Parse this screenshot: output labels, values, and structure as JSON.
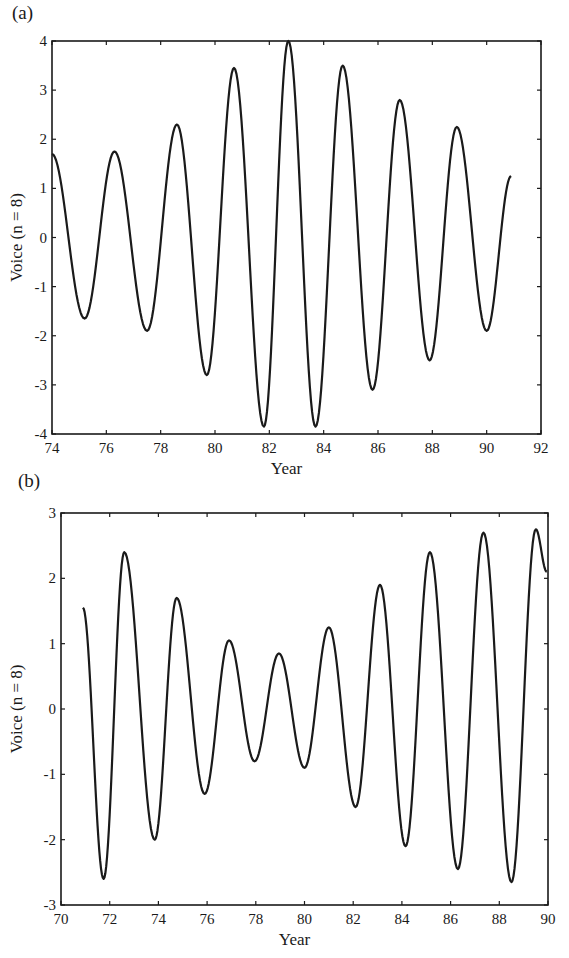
{
  "chart_data": [
    {
      "type": "line",
      "panel_label": "(a)",
      "title": "",
      "xlabel": "Year",
      "ylabel": "Voice (n = 8)",
      "xlim": [
        74,
        92
      ],
      "ylim": [
        -4,
        4
      ],
      "xticks": [
        74,
        76,
        78,
        80,
        82,
        84,
        86,
        88,
        90,
        92
      ],
      "yticks": [
        4,
        3,
        2,
        1,
        0,
        -1,
        -2,
        -3,
        -4
      ],
      "grid": false,
      "legend": null,
      "series": [
        {
          "name": "Voice (n = 8)",
          "x": [
            74.0,
            75.2,
            76.3,
            77.5,
            78.6,
            79.7,
            80.7,
            81.8,
            82.7,
            83.7,
            84.7,
            85.8,
            86.8,
            87.9,
            88.9,
            90.0,
            90.9
          ],
          "y": [
            1.7,
            -1.65,
            1.75,
            -1.9,
            2.3,
            -2.8,
            3.45,
            -3.85,
            4.0,
            -3.85,
            3.5,
            -3.1,
            2.8,
            -2.5,
            2.25,
            -1.9,
            1.25
          ]
        }
      ]
    },
    {
      "type": "line",
      "panel_label": "(b)",
      "title": "",
      "xlabel": "Year",
      "ylabel": "Voice (n = 8)",
      "xlim": [
        70,
        90
      ],
      "ylim": [
        -3,
        3
      ],
      "xticks": [
        70,
        72,
        74,
        76,
        78,
        80,
        82,
        84,
        86,
        88,
        90
      ],
      "xtick_labels": [
        "70",
        "72",
        "74",
        "76",
        "78",
        "80",
        "82",
        "84",
        "86",
        "88",
        "90"
      ],
      "yticks": [
        3,
        2,
        1,
        0,
        -1,
        -2,
        -3
      ],
      "grid": false,
      "legend": null,
      "series": [
        {
          "name": "Voice (n = 8)",
          "x": [
            70.9,
            71.75,
            72.6,
            73.85,
            74.75,
            75.9,
            76.9,
            77.95,
            78.95,
            80.0,
            81.0,
            82.1,
            83.1,
            84.15,
            85.15,
            86.3,
            87.35,
            88.5,
            89.5,
            89.95
          ],
          "y": [
            1.55,
            -2.6,
            2.4,
            -2.0,
            1.7,
            -1.3,
            1.05,
            -0.8,
            0.85,
            -0.9,
            1.25,
            -1.5,
            1.9,
            -2.1,
            2.4,
            -2.45,
            2.7,
            -2.65,
            2.75,
            2.1
          ]
        }
      ]
    }
  ],
  "layout": {
    "panels": [
      {
        "left": 52,
        "right": 541,
        "top": 41,
        "bottom": 434
      },
      {
        "left": 61,
        "right": 548,
        "top": 513,
        "bottom": 905
      }
    ],
    "line_color": "#1a1a1a"
  }
}
